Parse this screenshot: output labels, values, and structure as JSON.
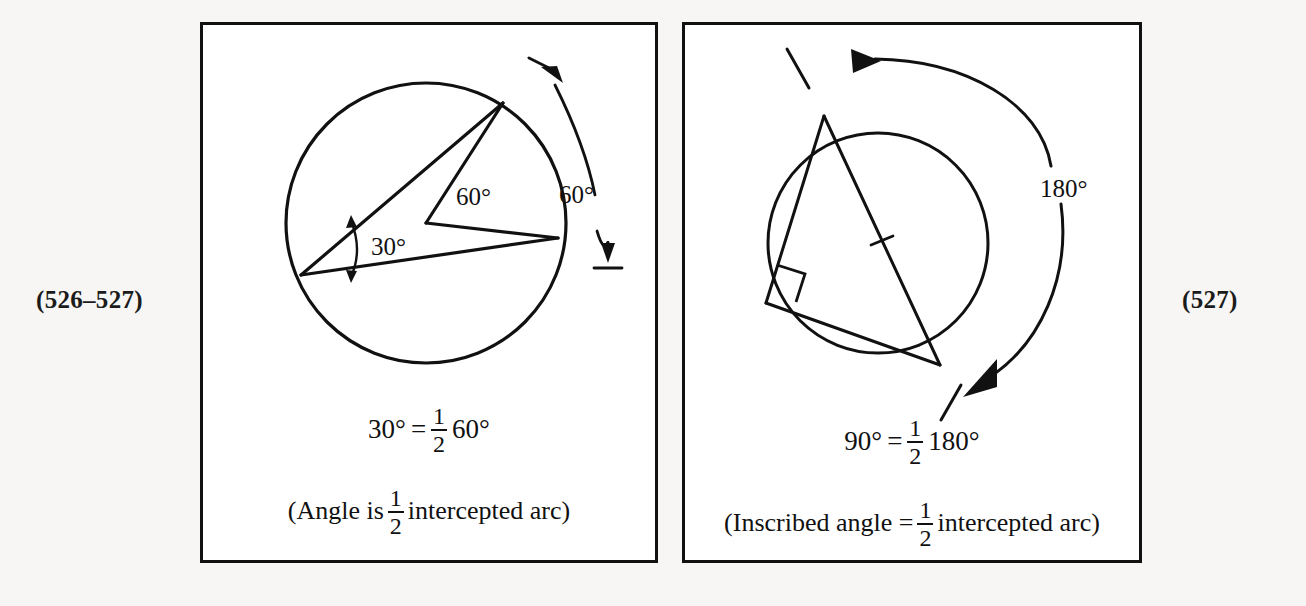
{
  "page": {
    "background_color": "#f7f6f4",
    "ink_color": "#111111",
    "panel_background": "#ffffff"
  },
  "refs": {
    "left": "(526–527)",
    "right": "(527)"
  },
  "panels": [
    {
      "id": "inscribed-angle-30",
      "figure": {
        "type": "circle-with-inscribed-angle",
        "circle": {
          "cx": 223,
          "cy": 198,
          "r": 140
        },
        "labels": {
          "inscribed_angle": "30°",
          "central_angle": "60°",
          "arc_measure": "60°"
        }
      },
      "caption": {
        "equation": {
          "left": "30°",
          "equals": "=",
          "frac_num": "1",
          "frac_den": "2",
          "right": "60°"
        },
        "note": {
          "before": "(Angle is",
          "frac_num": "1",
          "frac_den": "2",
          "after": "intercepted arc)"
        }
      }
    },
    {
      "id": "inscribed-angle-90",
      "figure": {
        "type": "circle-with-inscribed-right-triangle",
        "circle": {
          "cx": 193,
          "cy": 218,
          "r": 110
        },
        "labels": {
          "arc_measure": "180°"
        },
        "marks": {
          "right_angle": "right-angle-square",
          "diameter_tick": "single-tick"
        }
      },
      "caption": {
        "equation": {
          "left": "90°",
          "equals": "=",
          "frac_num": "1",
          "frac_den": "2",
          "right": "180°"
        },
        "note": {
          "before": "(Inscribed angle =",
          "frac_num": "1",
          "frac_den": "2",
          "after": "intercepted arc)"
        }
      }
    }
  ]
}
